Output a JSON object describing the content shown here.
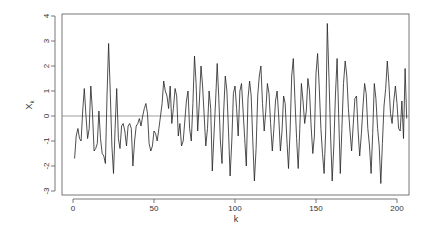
{
  "chart_data": {
    "type": "line",
    "title": "",
    "xlabel": "k",
    "ylabel": "X_k",
    "xlim": [
      0,
      200
    ],
    "ylim": [
      -3,
      4
    ],
    "xticks": [
      0,
      50,
      100,
      150,
      200
    ],
    "yticks": [
      -3,
      -2,
      -1,
      0,
      1,
      2,
      3,
      4
    ],
    "hline": 0,
    "grid": false,
    "legend": null,
    "series": [
      {
        "name": "X_k",
        "x_start": 1,
        "values": [
          -1.7,
          -0.8,
          -0.5,
          -0.9,
          -1.0,
          0.2,
          1.1,
          0.0,
          -0.9,
          -0.5,
          1.2,
          0.2,
          -1.4,
          -1.3,
          -1.1,
          0.2,
          -0.9,
          -1.5,
          -1.6,
          -1.9,
          0.8,
          2.9,
          0.9,
          -1.2,
          -2.3,
          -0.5,
          1.1,
          -0.9,
          -1.3,
          -0.4,
          -0.3,
          -0.6,
          -1.2,
          -0.4,
          -0.3,
          -0.5,
          -2.0,
          -1.0,
          -0.4,
          -0.3,
          -0.1,
          -0.4,
          0.0,
          0.3,
          0.5,
          0.1,
          -1.1,
          -1.4,
          -1.2,
          -0.6,
          -0.7,
          -1.0,
          -0.5,
          0.0,
          0.5,
          1.4,
          1.0,
          0.8,
          0.3,
          1.2,
          -0.3,
          0.3,
          1.1,
          0.8,
          -0.8,
          -0.3,
          -1.2,
          -1.0,
          -0.2,
          0.6,
          1.0,
          -0.5,
          -1.0,
          0.5,
          2.4,
          1.3,
          -0.6,
          0.6,
          2.0,
          1.2,
          0.0,
          -1.2,
          -0.5,
          1.0,
          0.3,
          -2.2,
          -0.8,
          0.6,
          2.1,
          0.7,
          -1.0,
          -1.9,
          0.2,
          1.6,
          1.0,
          -0.6,
          -2.4,
          -1.0,
          0.9,
          1.2,
          0.3,
          -0.8,
          1.0,
          1.3,
          0.2,
          -0.9,
          -2.0,
          0.7,
          1.4,
          0.8,
          -1.0,
          -2.6,
          -1.3,
          0.8,
          1.6,
          2.0,
          0.5,
          -0.6,
          0.2,
          1.3,
          0.9,
          -0.3,
          -1.4,
          -0.5,
          0.6,
          1.0,
          0.0,
          -1.4,
          -0.6,
          0.8,
          0.5,
          -0.9,
          -2.1,
          -0.6,
          1.6,
          2.3,
          0.7,
          -0.9,
          -2.1,
          -0.5,
          1.3,
          0.6,
          -0.3,
          0.2,
          1.5,
          1.0,
          -0.4,
          -1.5,
          -0.8,
          1.7,
          2.5,
          1.2,
          -0.5,
          -1.5,
          -2.3,
          -0.6,
          3.7,
          1.5,
          -0.8,
          -2.6,
          -1.2,
          0.8,
          2.3,
          0.0,
          -2.3,
          -0.5,
          1.3,
          2.2,
          1.6,
          0.3,
          -0.6,
          -1.4,
          -0.3,
          0.7,
          0.8,
          -0.6,
          -1.6,
          -0.7,
          0.4,
          1.3,
          0.9,
          -0.5,
          -1.2,
          -2.3,
          -0.7,
          1.3,
          0.7,
          -0.5,
          -1.2,
          -2.7,
          -1.1,
          0.4,
          1.1,
          2.2,
          1.3,
          0.1,
          -0.3,
          0.6,
          1.2,
          0.5,
          -0.5,
          -0.6,
          0.6,
          -0.9,
          1.9,
          -0.1
        ]
      }
    ]
  }
}
